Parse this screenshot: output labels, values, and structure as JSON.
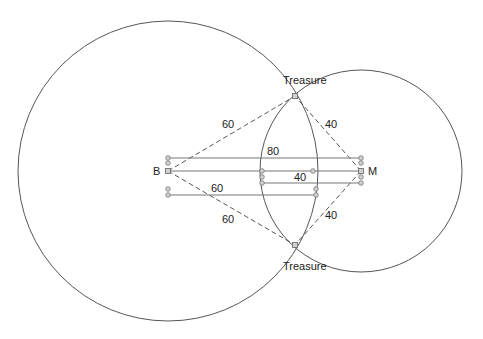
{
  "diagram": {
    "colors": {
      "circle": "#555555",
      "ruler": "#777777",
      "dashed": "#444444",
      "handle_fill": "#d0d0d0",
      "text": "#222222"
    },
    "points": {
      "B": {
        "label": "B",
        "x": 168,
        "y": 171
      },
      "M": {
        "label": "M",
        "x": 361,
        "y": 171
      },
      "treasure_top": {
        "label": "Treasure",
        "x": 295,
        "y": 96
      },
      "treasure_bottom": {
        "label": "Treasure",
        "x": 295,
        "y": 245
      }
    },
    "circles": [
      {
        "name": "circle-B",
        "cx": 168,
        "cy": 171,
        "r": 150,
        "radius_label": "60"
      },
      {
        "name": "circle-M",
        "cx": 361,
        "cy": 171,
        "r": 101,
        "radius_label": "40"
      }
    ],
    "rulers": [
      {
        "name": "ruler-80",
        "label": "80",
        "x1": 168,
        "x2": 361,
        "y": 158
      },
      {
        "name": "ruler-BM",
        "label": "",
        "x1": 168,
        "x2": 361,
        "y": 171
      },
      {
        "name": "ruler-40",
        "label": "40",
        "x1": 262,
        "x2": 361,
        "y": 183
      },
      {
        "name": "ruler-60",
        "label": "60",
        "x1": 168,
        "x2": 316,
        "y": 195
      }
    ],
    "labels": {
      "B": "B",
      "M": "M",
      "treasure_top": "Treasure",
      "treasure_bottom": "Treasure",
      "dist_B_top": "60",
      "dist_M_top": "40",
      "dist_B_bottom": "60",
      "dist_M_bottom": "40",
      "ruler_80": "80",
      "ruler_40": "40",
      "ruler_60": "60"
    }
  }
}
